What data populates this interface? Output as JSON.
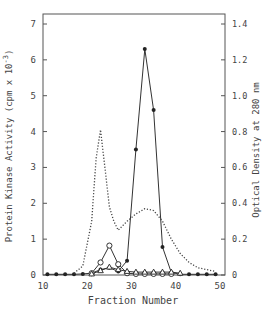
{
  "chart_data": {
    "type": "line",
    "title": "",
    "xlabel": "Fraction Number",
    "ylabel": "Protein Kinase Activity (cpm x 10^-3)",
    "ylabel_right": "Optical Density at 280 nm",
    "xlim": [
      10,
      50
    ],
    "ylim": [
      0,
      7
    ],
    "ylim_right": [
      0,
      1.4
    ],
    "xticks": [
      "10",
      "20",
      "30",
      "40",
      "50"
    ],
    "yticks": [
      "0",
      "1",
      "2",
      "3",
      "4",
      "5",
      "6",
      "7"
    ],
    "yticks_right": [
      "0",
      "0.2",
      "0.4",
      "0.6",
      "0.8",
      "1.0",
      "1.2",
      "1.4"
    ],
    "grid": false,
    "legend": "none",
    "series": [
      {
        "name": "Protein kinase activity (closed circles)",
        "axis": "left",
        "marker": "filled-circle",
        "style": "solid",
        "x": [
          11,
          13,
          15,
          17,
          19,
          21,
          23,
          25,
          27,
          29,
          31,
          33,
          35,
          37,
          39,
          41,
          43,
          45,
          47,
          49
        ],
        "y": [
          0.02,
          0.02,
          0.02,
          0.02,
          0.03,
          0.05,
          0.15,
          0.2,
          0.1,
          0.4,
          3.5,
          6.3,
          4.6,
          0.78,
          0.07,
          0.02,
          0.02,
          0.02,
          0.02,
          0.02
        ]
      },
      {
        "name": "Open circles",
        "axis": "left",
        "marker": "open-circle",
        "style": "solid",
        "x": [
          21,
          23,
          25,
          27,
          29,
          31,
          33,
          35,
          37,
          39
        ],
        "y": [
          0.05,
          0.35,
          0.82,
          0.3,
          0.05,
          0.03,
          0.03,
          0.03,
          0.03,
          0.03
        ]
      },
      {
        "name": "Open triangles",
        "axis": "left",
        "marker": "open-triangle",
        "style": "solid",
        "x": [
          21,
          23,
          25,
          27,
          29,
          31,
          33,
          35,
          37,
          39,
          41
        ],
        "y": [
          0.03,
          0.12,
          0.22,
          0.15,
          0.1,
          0.08,
          0.08,
          0.08,
          0.08,
          0.08,
          0.05
        ]
      },
      {
        "name": "Optical density at 280 nm",
        "axis": "right",
        "marker": "none",
        "style": "dotted",
        "x": [
          17,
          19,
          21,
          22,
          23,
          24,
          25,
          26,
          27,
          29,
          31,
          33,
          35,
          37,
          39,
          41,
          43,
          45,
          47,
          49
        ],
        "y": [
          0.01,
          0.05,
          0.3,
          0.65,
          0.81,
          0.6,
          0.38,
          0.3,
          0.25,
          0.3,
          0.34,
          0.37,
          0.36,
          0.3,
          0.2,
          0.12,
          0.07,
          0.04,
          0.03,
          0.02
        ]
      }
    ]
  }
}
